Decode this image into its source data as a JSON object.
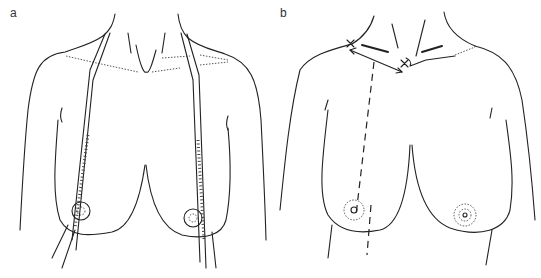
{
  "figure": {
    "panels": [
      {
        "id": "a",
        "label": "a",
        "description": "Torso with measuring tapes draped from neck over each nipple"
      },
      {
        "id": "b",
        "label": "b",
        "description": "Torso with markings at clavicle midpoint and sternal notch, dashed line to nipple"
      }
    ]
  },
  "colors": {
    "line": "#222222",
    "background": "#ffffff"
  }
}
